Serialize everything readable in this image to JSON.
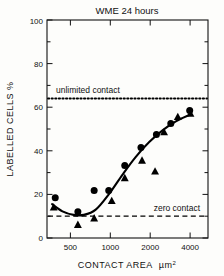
{
  "chart_data": {
    "type": "scatter",
    "title": "WME  24 hours",
    "xlabel": "CONTACT AREA",
    "xlabel_units": "µm",
    "xlabel_units_exp": "2",
    "ylabel": "LABELLED  CELLS  %",
    "xscale": "log",
    "xlim": [
      330,
      5200
    ],
    "ylim": [
      0,
      100
    ],
    "xticks": [
      500,
      1000,
      2000,
      4000
    ],
    "xticklabels": [
      "500",
      "1000",
      "2000",
      "4000"
    ],
    "yticks": [
      0,
      20,
      40,
      60,
      80,
      100
    ],
    "yticklabels": [
      "0",
      "20",
      "40",
      "60",
      "80",
      "100"
    ],
    "grid": false,
    "legend": "none",
    "series": [
      {
        "name": "circles",
        "marker": "circle",
        "color": "#000000",
        "points": [
          {
            "x": 380,
            "y": 18.5
          },
          {
            "x": 560,
            "y": 12.0
          },
          {
            "x": 740,
            "y": 21.8
          },
          {
            "x": 950,
            "y": 21.8
          },
          {
            "x": 1250,
            "y": 33.2
          },
          {
            "x": 1650,
            "y": 41.5
          },
          {
            "x": 2150,
            "y": 47.5
          },
          {
            "x": 2750,
            "y": 52.5
          },
          {
            "x": 3800,
            "y": 58.5
          }
        ]
      },
      {
        "name": "triangles",
        "marker": "triangle",
        "color": "#000000",
        "points": [
          {
            "x": 370,
            "y": 14.0
          },
          {
            "x": 560,
            "y": 6.0
          },
          {
            "x": 740,
            "y": 9.0
          },
          {
            "x": 1000,
            "y": 17.0
          },
          {
            "x": 1250,
            "y": 27.5
          },
          {
            "x": 1680,
            "y": 35.5
          },
          {
            "x": 2100,
            "y": 30.5
          },
          {
            "x": 2450,
            "y": 48.5
          },
          {
            "x": 3100,
            "y": 55.5
          },
          {
            "x": 3850,
            "y": 57.0
          }
        ]
      }
    ],
    "fit_curve": {
      "name": "fitted-curve",
      "points": [
        {
          "x": 360,
          "y": 15.5
        },
        {
          "x": 430,
          "y": 12.2
        },
        {
          "x": 520,
          "y": 10.6
        },
        {
          "x": 620,
          "y": 10.6
        },
        {
          "x": 760,
          "y": 13.0
        },
        {
          "x": 950,
          "y": 20.0
        },
        {
          "x": 1200,
          "y": 29.0
        },
        {
          "x": 1500,
          "y": 37.0
        },
        {
          "x": 1900,
          "y": 44.0
        },
        {
          "x": 2400,
          "y": 49.5
        },
        {
          "x": 3000,
          "y": 53.5
        },
        {
          "x": 3800,
          "y": 56.5
        }
      ]
    },
    "reference_lines": [
      {
        "name": "unlimited-contact",
        "label": "unlimited contact",
        "y": 64,
        "style": "dotted"
      },
      {
        "name": "zero-contact",
        "label": "zero contact",
        "y": 10,
        "style": "dashed"
      }
    ]
  }
}
